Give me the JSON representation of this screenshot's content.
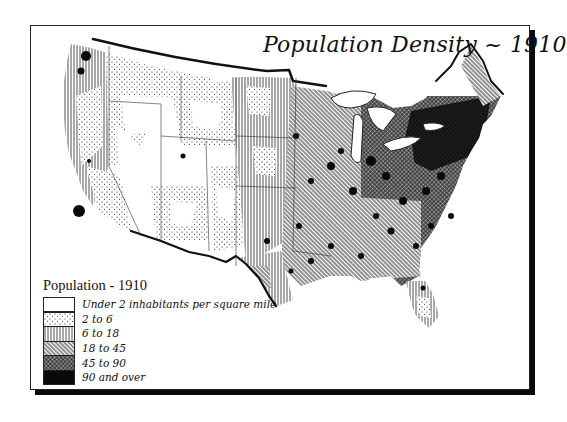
{
  "map": {
    "title": "Population Density ~ 1910",
    "subject": "United States population density by county, 1910",
    "colors": {
      "ink": "#111111",
      "paper": "#ffffff",
      "shadow": "#0a0a0a"
    }
  },
  "legend": {
    "title": "Population - 1910",
    "items": [
      {
        "label": "Under 2 inhabitants per square mile",
        "pattern": "blank",
        "fill": "#ffffff"
      },
      {
        "label": "2 to 6",
        "pattern": "stipple",
        "fill": "#e6e6e6"
      },
      {
        "label": "6 to 18",
        "pattern": "vertical-lines",
        "fill": "#cfcfcf"
      },
      {
        "label": "18 to 45",
        "pattern": "diagonal-hatch",
        "fill": "#a8a8a8"
      },
      {
        "label": "45 to 90",
        "pattern": "crosshatch",
        "fill": "#6e6e6e"
      },
      {
        "label": "90 and over",
        "pattern": "solid",
        "fill": "#0a0a0a"
      }
    ]
  },
  "regions_summary": [
    {
      "region": "Pacific Northwest & Great Basin",
      "dominant_class": "Under 2 / 2 to 6"
    },
    {
      "region": "Mountain West & Southwest",
      "dominant_class": "Under 2 / 2 to 6"
    },
    {
      "region": "Great Plains",
      "dominant_class": "6 to 18"
    },
    {
      "region": "Midwest",
      "dominant_class": "18 to 45 / 45 to 90"
    },
    {
      "region": "Northeast",
      "dominant_class": "45 to 90 / 90 and over"
    },
    {
      "region": "South",
      "dominant_class": "18 to 45"
    },
    {
      "region": "Florida",
      "dominant_class": "2 to 6 / 6 to 18"
    }
  ]
}
